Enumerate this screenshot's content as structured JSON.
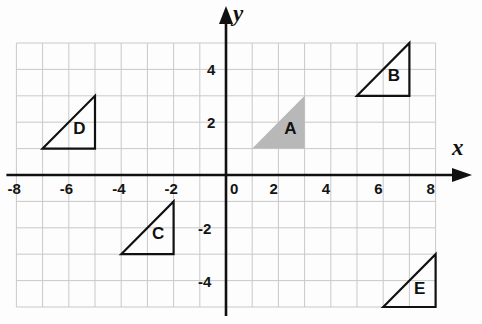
{
  "figure": {
    "title": "",
    "background_color": "#fdfdfd",
    "grid_color": "#c9c9c9",
    "axis_color": "#111111",
    "shape_outline_color": "#111111",
    "shape_fill_gray": "#b8b8b8"
  },
  "axes": {
    "x_label": "x",
    "y_label": "y",
    "x_ticks": [
      {
        "value": -8,
        "label": "-8"
      },
      {
        "value": -6,
        "label": "-6"
      },
      {
        "value": -4,
        "label": "-4"
      },
      {
        "value": -2,
        "label": "-2"
      },
      {
        "value": 0,
        "label": "0"
      },
      {
        "value": 2,
        "label": "2"
      },
      {
        "value": 4,
        "label": "4"
      },
      {
        "value": 6,
        "label": "6"
      },
      {
        "value": 8,
        "label": "8"
      }
    ],
    "y_ticks": [
      {
        "value": 4,
        "label": "4"
      },
      {
        "value": 2,
        "label": "2"
      },
      {
        "value": -2,
        "label": "-2"
      },
      {
        "value": -4,
        "label": "-4"
      }
    ]
  },
  "chart_data": {
    "type": "scatter",
    "title": "",
    "xlabel": "x",
    "ylabel": "y",
    "xlim": [
      -8,
      8
    ],
    "ylim": [
      -5,
      5
    ],
    "grid": true,
    "grid_step": 1,
    "legend": "none",
    "x_tick_values": [
      -8,
      -6,
      -4,
      -2,
      0,
      2,
      4,
      6,
      8
    ],
    "y_tick_values": [
      4,
      2,
      -2,
      -4
    ],
    "shapes": [
      {
        "name": "A",
        "label": "A",
        "kind": "right-triangle",
        "fill": "#b8b8b8",
        "stroke": "none",
        "vertices": [
          [
            1,
            1
          ],
          [
            3,
            3
          ],
          [
            3,
            1
          ]
        ],
        "right_angle_at": [
          3,
          1
        ],
        "label_position": [
          2.45,
          1.75
        ]
      },
      {
        "name": "B",
        "label": "B",
        "kind": "right-triangle",
        "fill": "none",
        "stroke": "#111111",
        "vertices": [
          [
            5,
            3
          ],
          [
            7,
            5
          ],
          [
            7,
            3
          ]
        ],
        "right_angle_at": [
          7,
          3
        ],
        "label_position": [
          6.4,
          3.75
        ]
      },
      {
        "name": "C",
        "label": "C",
        "kind": "right-triangle",
        "fill": "none",
        "stroke": "#111111",
        "vertices": [
          [
            -4,
            -3
          ],
          [
            -2,
            -1
          ],
          [
            -2,
            -3
          ]
        ],
        "right_angle_at": [
          -2,
          -3
        ],
        "label_position": [
          -2.6,
          -2.25
        ]
      },
      {
        "name": "D",
        "label": "D",
        "kind": "right-triangle",
        "fill": "none",
        "stroke": "#111111",
        "vertices": [
          [
            -7,
            1
          ],
          [
            -5,
            3
          ],
          [
            -5,
            1
          ]
        ],
        "right_angle_at": [
          -5,
          1
        ],
        "label_position": [
          -5.6,
          1.75
        ]
      },
      {
        "name": "E",
        "label": "E",
        "kind": "right-triangle",
        "fill": "none",
        "stroke": "#111111",
        "vertices": [
          [
            6,
            -5
          ],
          [
            8,
            -3
          ],
          [
            8,
            -5
          ]
        ],
        "right_angle_at": [
          8,
          -5
        ],
        "label_position": [
          7.4,
          -4.3
        ]
      }
    ]
  }
}
